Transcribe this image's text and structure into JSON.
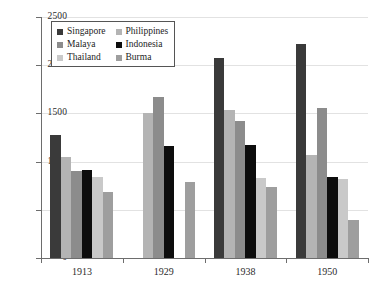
{
  "chart_data": {
    "type": "bar",
    "title": "",
    "xlabel": "",
    "ylabel": "",
    "ylim": [
      0,
      2500
    ],
    "ytick_values": [
      0,
      500,
      1000,
      1500,
      2000,
      2500
    ],
    "ytick_labels": [
      "0",
      "500",
      "1000",
      "1500",
      "2000",
      "2500"
    ],
    "grid": true,
    "legend_position": "upper-left-inside",
    "categories": [
      "1913",
      "1929",
      "1938",
      "1950"
    ],
    "series": [
      {
        "name": "Singapore",
        "color": "#3a3a3a",
        "values": [
          1280,
          null,
          2070,
          2215
        ]
      },
      {
        "name": "Philippines",
        "color": "#b4b4b4",
        "values": [
          1045,
          1500,
          1535,
          1065
        ]
      },
      {
        "name": "Malaya",
        "color": "#8c8c8c",
        "values": [
          900,
          1675,
          1425,
          1555
        ]
      },
      {
        "name": "Indonesia",
        "color": "#0d0d0d",
        "values": [
          910,
          1165,
          1170,
          845
        ]
      },
      {
        "name": "Thailand",
        "color": "#c9c9c9",
        "values": [
          840,
          null,
          825,
          820
        ]
      },
      {
        "name": "Burma",
        "color": "#9e9e9e",
        "values": [
          680,
          790,
          740,
          390
        ]
      }
    ],
    "legend_entries": [
      {
        "label": "Singapore",
        "swatch": "#3a3a3a"
      },
      {
        "label": "Philippines",
        "swatch": "#b4b4b4"
      },
      {
        "label": "Malaya",
        "swatch": "#8c8c8c"
      },
      {
        "label": "Indonesia",
        "swatch": "#0d0d0d"
      },
      {
        "label": "Thailand",
        "swatch": "#c9c9c9"
      },
      {
        "label": "Burma",
        "swatch": "#9e9e9e"
      }
    ],
    "axis_color": "#6d6d6d",
    "grid_color": "#e2e2e2",
    "background": "#ffffff"
  }
}
